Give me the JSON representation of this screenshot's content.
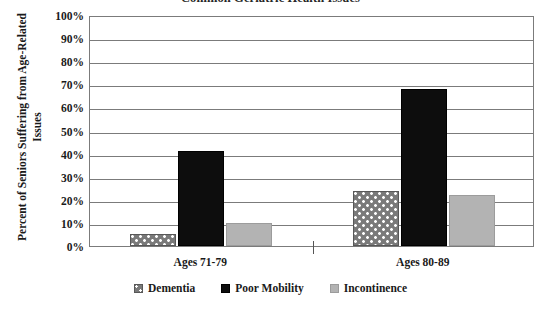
{
  "chart_data": {
    "type": "bar",
    "title": "Common Geriatric Health Issues",
    "xlabel": "",
    "ylabel": "Percent of Seniors Suffering from Age-Related Issues",
    "categories": [
      "Ages 71-79",
      "Ages 80-89"
    ],
    "series": [
      {
        "name": "Dementia",
        "values": [
          5,
          24
        ],
        "color": "#7a7a7a",
        "pattern": "dotted"
      },
      {
        "name": "Poor Mobility",
        "values": [
          41,
          68
        ],
        "color": "#0d0d0d",
        "pattern": "solid"
      },
      {
        "name": "Incontinence",
        "values": [
          10,
          22
        ],
        "color": "#b3b3b3",
        "pattern": "solid"
      }
    ],
    "ylim": [
      0,
      100
    ],
    "ytick_labels": [
      "100%",
      "90%",
      "80%",
      "70%",
      "60%",
      "50%",
      "40%",
      "30%",
      "20%",
      "10%",
      "0%"
    ],
    "ytick_values": [
      100,
      90,
      80,
      70,
      60,
      50,
      40,
      30,
      20,
      10,
      0
    ],
    "grid": true,
    "legend_position": "bottom"
  }
}
